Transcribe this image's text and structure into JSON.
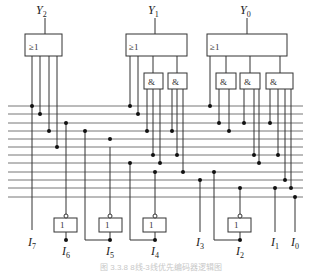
{
  "figure": {
    "outputs": [
      {
        "name": "Y",
        "sub": "2",
        "x": 42
      },
      {
        "name": "Y",
        "sub": "1",
        "x": 153
      },
      {
        "name": "Y",
        "sub": "0",
        "x": 245
      }
    ],
    "inputs": [
      {
        "name": "I",
        "sub": "7",
        "x": 32
      },
      {
        "name": "I",
        "sub": "6",
        "x": 66
      },
      {
        "name": "I",
        "sub": "5",
        "x": 110
      },
      {
        "name": "I",
        "sub": "4",
        "x": 155
      },
      {
        "name": "I",
        "sub": "3",
        "x": 200
      },
      {
        "name": "I",
        "sub": "2",
        "x": 240
      },
      {
        "name": "I",
        "sub": "1",
        "x": 275
      },
      {
        "name": "I",
        "sub": "0",
        "x": 295
      }
    ],
    "or_gate_symbol": "≥1",
    "and_gate_symbol": "&",
    "not_gate_symbol": "1",
    "caption": "图 3.3.8 8线-3线优先编码器逻辑图"
  }
}
